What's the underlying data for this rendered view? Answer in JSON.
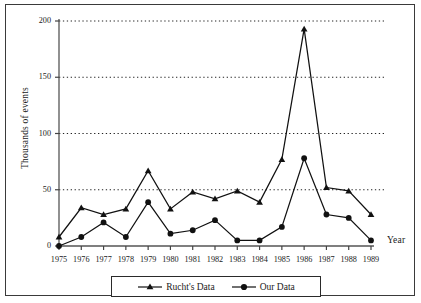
{
  "chart_data": {
    "type": "line",
    "title": "",
    "xlabel": "Year",
    "ylabel": "Thousands of events",
    "categories": [
      "1975",
      "1976",
      "1977",
      "1978",
      "1979",
      "1980",
      "1981",
      "1982",
      "1983",
      "1984",
      "1985",
      "1986",
      "1987",
      "1988",
      "1989"
    ],
    "x_tick_labels": [
      "1975",
      "1976",
      "1977",
      "1978",
      "1979",
      "1980",
      "1981",
      "1982",
      "1983",
      "1984",
      "1985",
      "1986",
      "1987",
      "1988",
      "1989"
    ],
    "y_tick_labels": [
      "0",
      "50",
      "100",
      "150",
      "200"
    ],
    "y_ticks": [
      0,
      50,
      100,
      150,
      200
    ],
    "ylim": [
      0,
      200
    ],
    "grid": "horizontal-dotted",
    "legend_position": "bottom",
    "series": [
      {
        "name": "Rucht's Data",
        "marker": "triangle",
        "color": "#111111",
        "values": [
          8,
          34,
          28,
          33,
          67,
          33,
          48,
          42,
          49,
          39,
          77,
          193,
          52,
          49,
          28
        ]
      },
      {
        "name": "Our Data",
        "marker": "circle",
        "color": "#111111",
        "values": [
          0,
          8,
          21,
          8,
          39,
          11,
          14,
          23,
          5,
          5,
          17,
          78,
          28,
          25,
          5
        ]
      }
    ]
  },
  "legend": {
    "entries": [
      {
        "label": "Rucht's Data",
        "marker": "triangle-marker-icon"
      },
      {
        "label": "Our Data",
        "marker": "circle-marker-icon"
      }
    ]
  },
  "axes": {
    "x_axis_title": "Year",
    "y_axis_title": "Thousands of events"
  }
}
